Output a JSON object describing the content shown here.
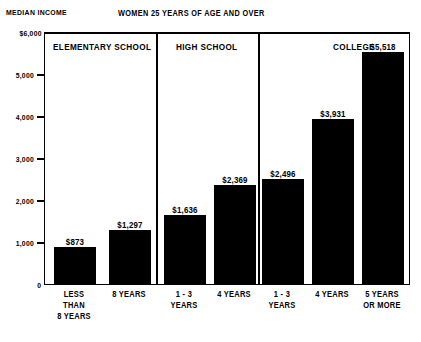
{
  "labels": {
    "median_income": "MEDIAN INCOME",
    "title": "WOMEN 25 YEARS OF AGE AND OVER"
  },
  "colors": {
    "bar": "#000000",
    "frame": "#000000",
    "background": "#ffffff"
  },
  "axis": {
    "ticks": [
      {
        "label": "$6,000",
        "value": 6000
      },
      {
        "label": "5,000",
        "value": 5000
      },
      {
        "label": "4,000",
        "value": 4000
      },
      {
        "label": "3,000",
        "value": 3000
      },
      {
        "label": "2,000",
        "value": 2000
      },
      {
        "label": "1,000",
        "value": 1000
      },
      {
        "label": "0",
        "value": 0
      }
    ]
  },
  "panels": [
    {
      "label": "ELEMENTARY SCHOOL",
      "align": "left"
    },
    {
      "label": "HIGH SCHOOL",
      "align": "center"
    },
    {
      "label": "COLLEGE",
      "align": "right"
    }
  ],
  "bars": [
    {
      "panel": "ELEMENTARY SCHOOL",
      "category_lines": [
        "LESS",
        "THAN",
        "8 YEARS"
      ],
      "value": 873,
      "value_label": "$873"
    },
    {
      "panel": "ELEMENTARY SCHOOL",
      "category_lines": [
        "8 YEARS"
      ],
      "value": 1297,
      "value_label": "$1,297"
    },
    {
      "panel": "HIGH SCHOOL",
      "category_lines": [
        "1 - 3",
        "YEARS"
      ],
      "value": 1636,
      "value_label": "$1,636"
    },
    {
      "panel": "HIGH SCHOOL",
      "category_lines": [
        "4 YEARS"
      ],
      "value": 2369,
      "value_label": "$2,369"
    },
    {
      "panel": "COLLEGE",
      "category_lines": [
        "1 - 3",
        "YEARS"
      ],
      "value": 2496,
      "value_label": "$2,496"
    },
    {
      "panel": "COLLEGE",
      "category_lines": [
        "4 YEARS"
      ],
      "value": 3931,
      "value_label": "$3,931"
    },
    {
      "panel": "COLLEGE",
      "category_lines": [
        "5 YEARS",
        "OR MORE"
      ],
      "value": 5518,
      "value_label": "$5,518"
    }
  ],
  "chart_data": {
    "type": "bar",
    "title": "WOMEN 25 YEARS OF AGE AND OVER",
    "subtitle": "",
    "xlabel": "",
    "ylabel": "MEDIAN INCOME",
    "ylim": [
      0,
      6000
    ],
    "ytick_values": [
      0,
      1000,
      2000,
      3000,
      4000,
      5000,
      6000
    ],
    "ytick_labels": [
      "0",
      "1,000",
      "2,000",
      "3,000",
      "4,000",
      "5,000",
      "$6,000"
    ],
    "grid": false,
    "legend": null,
    "groups": [
      "ELEMENTARY SCHOOL",
      "HIGH SCHOOL",
      "COLLEGE"
    ],
    "categories": [
      "LESS THAN 8 YEARS",
      "8 YEARS",
      "1 - 3 YEARS",
      "4 YEARS",
      "1 - 3 YEARS",
      "4 YEARS",
      "5 YEARS OR MORE"
    ],
    "values": [
      873,
      1297,
      1636,
      2369,
      2496,
      3931,
      5518
    ],
    "data_labels": [
      "$873",
      "$1,297",
      "$1,636",
      "$2,369",
      "$2,496",
      "$3,931",
      "$5,518"
    ],
    "group_of_category": [
      "ELEMENTARY SCHOOL",
      "ELEMENTARY SCHOOL",
      "HIGH SCHOOL",
      "HIGH SCHOOL",
      "COLLEGE",
      "COLLEGE",
      "COLLEGE"
    ]
  }
}
